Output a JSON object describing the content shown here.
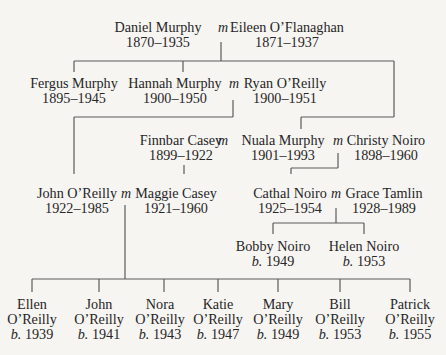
{
  "diagram": {
    "type": "family-tree",
    "marriage_symbol": "m",
    "birth_prefix": "b.",
    "people": {
      "daniel_murphy": {
        "name": "Daniel Murphy",
        "dates": "1870–1935"
      },
      "eileen_oflanaghan": {
        "name": "Eileen O’Flanaghan",
        "dates": "1871–1937"
      },
      "fergus_murphy": {
        "name": "Fergus Murphy",
        "dates": "1895–1945"
      },
      "hannah_murphy": {
        "name": "Hannah Murphy",
        "dates": "1900–1950"
      },
      "ryan_oreilly": {
        "name": "Ryan O’Reilly",
        "dates": "1900–1951"
      },
      "finnbar_casey": {
        "name": "Finnbar Casey",
        "dates": "1899–1922"
      },
      "nuala_murphy": {
        "name": "Nuala Murphy",
        "dates": "1901–1993"
      },
      "christy_noiro": {
        "name": "Christy Noiro",
        "dates": "1898–1960"
      },
      "john_oreilly_sr": {
        "name": "John O’Reilly",
        "dates": "1922–1985"
      },
      "maggie_casey": {
        "name": "Maggie Casey",
        "dates": "1921–1960"
      },
      "cathal_noiro": {
        "name": "Cathal Noiro",
        "dates": "1925–1954"
      },
      "grace_tamlin": {
        "name": "Grace Tamlin",
        "dates": "1928–1989"
      },
      "bobby_noiro": {
        "name": "Bobby Noiro",
        "born": "1949"
      },
      "helen_noiro": {
        "name": "Helen Noiro",
        "born": "1953"
      },
      "ellen_oreilly": {
        "first": "Ellen",
        "last": "O’Reilly",
        "born": "1939"
      },
      "john_oreilly_jr": {
        "first": "John",
        "last": "O’Reilly",
        "born": "1941"
      },
      "nora_oreilly": {
        "first": "Nora",
        "last": "O’Reilly",
        "born": "1943"
      },
      "katie_oreilly": {
        "first": "Katie",
        "last": "O’Reilly",
        "born": "1947"
      },
      "mary_oreilly": {
        "first": "Mary",
        "last": "O’Reilly",
        "born": "1949"
      },
      "bill_oreilly": {
        "first": "Bill",
        "last": "O’Reilly",
        "born": "1953"
      },
      "patrick_oreilly": {
        "first": "Patrick",
        "last": "O’Reilly",
        "born": "1955"
      }
    },
    "marriages": [
      [
        "daniel_murphy",
        "eileen_oflanaghan"
      ],
      [
        "hannah_murphy",
        "ryan_oreilly"
      ],
      [
        "finnbar_casey",
        "nuala_murphy"
      ],
      [
        "nuala_murphy",
        "christy_noiro"
      ],
      [
        "john_oreilly_sr",
        "maggie_casey"
      ],
      [
        "cathal_noiro",
        "grace_tamlin"
      ]
    ]
  }
}
